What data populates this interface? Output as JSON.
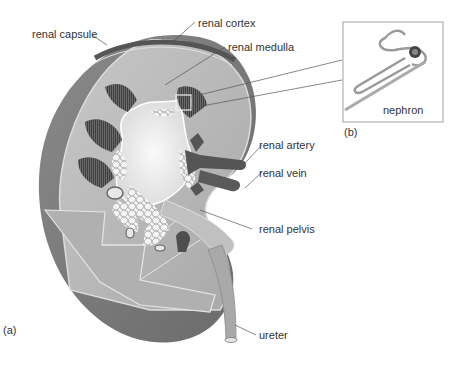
{
  "diagram": {
    "panel_a_tag": "(a)",
    "panel_b_tag": "(b)",
    "labels": {
      "renal_capsule": "renal capsule",
      "renal_cortex": "renal cortex",
      "renal_medulla": "renal medulla",
      "renal_artery": "renal artery",
      "renal_vein": "renal vein",
      "renal_pelvis": "renal pelvis",
      "ureter": "ureter",
      "nephron": "nephron"
    },
    "colors": {
      "capsule": "#6e6e6e",
      "cortex": "#b4b4b4",
      "medulla_pyramids": "#4a4a4a",
      "pelvis": "#ebebeb",
      "vessels": "#555555",
      "background": "#ffffff"
    }
  }
}
